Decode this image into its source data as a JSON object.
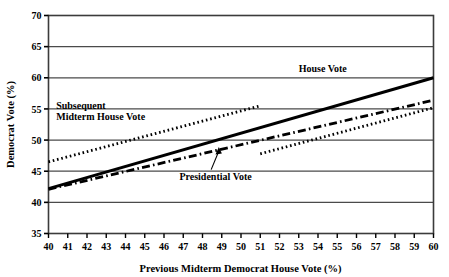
{
  "chart_data": {
    "type": "line",
    "title": "",
    "xlabel": "Previous Midterm Democrat House Vote (%)",
    "ylabel": "Democrat Vote (%)",
    "xlim": [
      40,
      60
    ],
    "ylim": [
      35,
      70
    ],
    "xticks": [
      40,
      41,
      42,
      43,
      44,
      45,
      46,
      47,
      48,
      49,
      50,
      51,
      52,
      53,
      54,
      55,
      56,
      57,
      58,
      59,
      60
    ],
    "yticks": [
      35,
      40,
      45,
      50,
      55,
      60,
      65,
      70
    ],
    "grid": "horizontal",
    "legend": "inline-annotations",
    "series": [
      {
        "name": "House Vote",
        "style": "solid",
        "x": [
          40,
          60
        ],
        "values": [
          42.2,
          60.0
        ]
      },
      {
        "name": "Presidential Vote",
        "style": "dash-dot",
        "x": [
          40,
          60
        ],
        "values": [
          42.1,
          56.4
        ]
      },
      {
        "name": "Subsequent Midterm House Vote",
        "style": "dotted",
        "x": [
          40,
          51
        ],
        "values": [
          46.5,
          55.5
        ]
      },
      {
        "name": "Subsequent Midterm House Vote (lower segment)",
        "style": "dotted",
        "x": [
          51,
          60
        ],
        "values": [
          47.8,
          55.2
        ]
      }
    ],
    "annotations": [
      {
        "name": "house-vote-label",
        "text": "House Vote",
        "x": 53.0,
        "y": 61.0
      },
      {
        "name": "subsequent-label-line1",
        "text": "Subsequent",
        "x": 40.4,
        "y": 55.0
      },
      {
        "name": "subsequent-label-line2",
        "text": "Midterm House Vote",
        "x": 40.4,
        "y": 53.2
      },
      {
        "name": "presidential-vote-label",
        "text": "Presidential Vote",
        "x": 46.8,
        "y": 43.6
      }
    ]
  },
  "axes": {
    "x_title": "Previous Midterm Democrat House Vote (%)",
    "y_title": "Democrat Vote (%)",
    "x_tick_labels": [
      "40",
      "41",
      "42",
      "43",
      "44",
      "45",
      "46",
      "47",
      "48",
      "49",
      "50",
      "51",
      "52",
      "53",
      "54",
      "55",
      "56",
      "57",
      "58",
      "59",
      "60"
    ],
    "y_tick_labels": [
      "35",
      "40",
      "45",
      "50",
      "55",
      "60",
      "65",
      "70"
    ]
  },
  "labels": {
    "house_vote": "House Vote",
    "subsequent_line1": "Subsequent",
    "subsequent_line2": "Midterm House Vote",
    "presidential_vote": "Presidential Vote"
  },
  "colors": {
    "ink": "#000000",
    "background": "#ffffff",
    "grid": "#4a4a4a"
  }
}
